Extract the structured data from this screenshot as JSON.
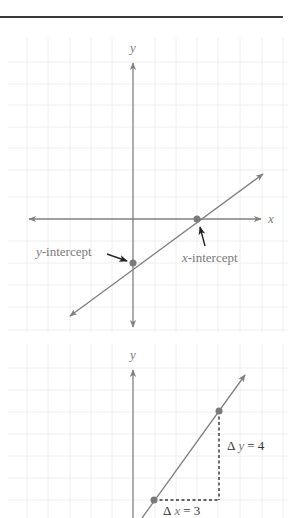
{
  "colors": {
    "header_rule": "#3a3a3a",
    "grid": "#eeeeee",
    "axis": "#808080",
    "line": "#808080",
    "point": "#7a7a7a",
    "label": "#333333",
    "variable": "#7a7a7a",
    "callout_arrow": "#222222",
    "dashed": "#333333"
  },
  "figure1": {
    "x_axis_label": "x",
    "y_axis_label": "y",
    "y_intercept_label_var": "y",
    "y_intercept_label_rest": "-intercept",
    "x_intercept_label_var": "x",
    "x_intercept_label_rest": "-intercept",
    "origin_px": [
      133,
      219
    ],
    "grid_spacing_px": 21.5,
    "y_intercept_point_px": [
      133,
      263
    ],
    "x_intercept_point_px": [
      197,
      219
    ]
  },
  "figure2": {
    "y_axis_label": "y",
    "delta_y_prefix": "Δ",
    "delta_y_var": "y",
    "delta_y_suffix": "= 4",
    "delta_x_prefix": "Δ",
    "delta_x_var": "x",
    "delta_x_suffix": "= 3",
    "delta_x_value": 3,
    "delta_y_value": 4,
    "point_lower_px": [
      154,
      500
    ],
    "point_upper_px": [
      219,
      411
    ]
  }
}
